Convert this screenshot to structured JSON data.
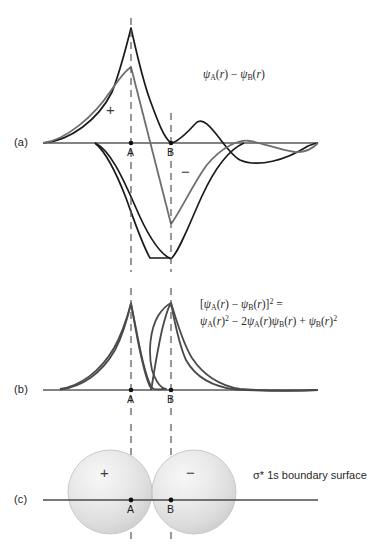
{
  "figure": {
    "width": 382,
    "height": 548,
    "background": "#ffffff"
  },
  "panels": {
    "a": {
      "label": "(a)",
      "formula_line1": "ψA(r) − ψB(r)",
      "plus_sign": "+",
      "minus_sign": "−",
      "point_a": "A",
      "point_b": "B"
    },
    "b": {
      "label": "(b)",
      "formula_line1": "[ψA(r) − ψB(r)]2 =",
      "formula_line2": "ψA(r)2 − 2ψA(r)ψB(r) + ψB(r)2",
      "point_a": "A",
      "point_b": "B"
    },
    "c": {
      "label": "(c)",
      "caption": "σ* 1s boundary surface",
      "plus_sign": "+",
      "minus_sign": "−",
      "point_a": "A",
      "point_b": "B"
    }
  },
  "symbols": {
    "psi": "ψ",
    "sigma": "σ",
    "minus": "−",
    "plus": "+",
    "asterisk": "*",
    "sub_a": "A",
    "sub_b": "B",
    "var_r": "r",
    "exp_two": "2",
    "coeff_two": "2",
    "equals": "=",
    "orbital": "1s",
    "bracket_open": "[",
    "bracket_close": "]",
    "paren_open": "(",
    "paren_close": ")"
  },
  "colors": {
    "curve_black": "#1a1a1a",
    "curve_gray": "#6e6e6e",
    "axis": "#5a5a5a",
    "dashed": "#555555",
    "sphere_fill": "#e3e3e3",
    "sphere_edge": "#bdbdbd",
    "text": "#1b1b1b"
  },
  "geometry": {
    "nucleus_a_x": 131,
    "nucleus_b_x": 171,
    "panel_a_baseline_y": 143,
    "panel_b_baseline_y": 390,
    "panel_c_baseline_y": 500
  }
}
